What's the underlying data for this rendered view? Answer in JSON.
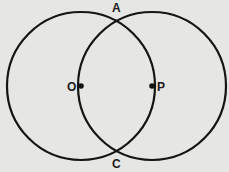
{
  "diagram": {
    "type": "two intersecting circles",
    "colors": {
      "background": "#e6e6e4",
      "stroke": "#141414"
    },
    "circles": [
      {
        "name": "circle-centered-O",
        "center": "O",
        "cx": 81,
        "cy": 86,
        "r": 74
      },
      {
        "name": "circle-centered-P",
        "center": "P",
        "cx": 152,
        "cy": 86,
        "r": 74
      }
    ],
    "points": [
      {
        "label": "O",
        "role": "center of left circle",
        "x": 81,
        "y": 86
      },
      {
        "label": "P",
        "role": "center of right circle",
        "x": 152,
        "y": 86
      },
      {
        "label": "A",
        "role": "upper intersection"
      },
      {
        "label": "C",
        "role": "lower intersection"
      }
    ],
    "labels": {
      "a": "A",
      "c": "C",
      "o": "O",
      "p": "P"
    }
  }
}
